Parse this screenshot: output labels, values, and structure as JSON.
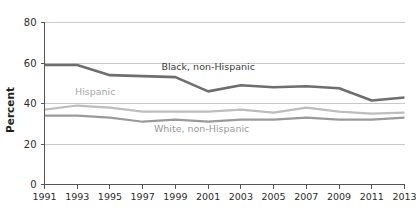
{
  "chart_data": {
    "type": "line",
    "title": "",
    "xlabel": "",
    "ylabel": "Percent",
    "ylim": [
      0,
      80
    ],
    "yticks": [
      0,
      20,
      40,
      60,
      80
    ],
    "ytick_labels": [
      "0",
      "20",
      "40",
      "60",
      "80"
    ],
    "grid": true,
    "grid_axis": "y",
    "legend": "inline-annotations",
    "x": [
      1991,
      1993,
      1995,
      1997,
      1999,
      2001,
      2003,
      2005,
      2007,
      2009,
      2011,
      2013
    ],
    "categories": [
      "1991",
      "1993",
      "1995",
      "1997",
      "1999",
      "2001",
      "2003",
      "2005",
      "2007",
      "2009",
      "2011",
      "2013"
    ],
    "series": [
      {
        "name": "Black, non-Hispanic",
        "color": "#6e6e6e",
        "values": [
          59,
          59,
          54,
          53.5,
          53,
          46,
          49,
          48,
          48.5,
          47.5,
          41.5,
          43
        ]
      },
      {
        "name": "Hispanic",
        "color": "#bdbdbd",
        "values": [
          37,
          39,
          38,
          36,
          36,
          36,
          37,
          35.5,
          38,
          36,
          35,
          35.5
        ]
      },
      {
        "name": "White, non-Hispanic",
        "color": "#9a9a9a",
        "values": [
          34,
          34,
          33,
          31,
          32,
          31,
          32,
          32,
          33,
          32,
          32,
          33
        ]
      }
    ],
    "annotations": [
      {
        "text": "Black, non-Hispanic",
        "x": 2001,
        "y": 56.5,
        "color": "#3a3a3a",
        "anchor": "middle"
      },
      {
        "text": "Hispanic",
        "x": 1994.1,
        "y": 44.0,
        "color": "#a6a6a6",
        "anchor": "middle"
      },
      {
        "text": "White, non-Hispanic",
        "x": 2000.6,
        "y": 26.0,
        "color": "#9a9a9a",
        "anchor": "middle"
      }
    ]
  },
  "axis": {
    "y_title": "Percent"
  },
  "colors": {
    "black_series": "#6e6e6e",
    "hispanic_series": "#bdbdbd",
    "white_series": "#9a9a9a",
    "gridline": "#c9c9c9",
    "axis": "#555555",
    "text": "#2b2b2b",
    "background": "#ffffff"
  }
}
